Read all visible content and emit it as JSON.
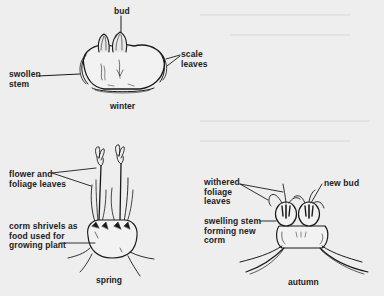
{
  "diagram": {
    "panels": [
      {
        "id": "winter",
        "caption": "winter",
        "labels": {
          "bud": "bud",
          "scale_leaves": "scale\nleaves",
          "swollen_stem": "swollen\nstem"
        }
      },
      {
        "id": "spring",
        "caption": "spring",
        "labels": {
          "flower_foliage": "flower and\nfoliage leaves",
          "corm_shrivels": "corm shrivels as\nfood used for\ngrowing plant"
        }
      },
      {
        "id": "autumn",
        "caption": "autumn",
        "labels": {
          "withered": "withered\nfoliage\nleaves",
          "new_bud": "new bud",
          "swelling_stem": "swelling stem\nforming new\ncorm"
        }
      }
    ]
  },
  "colors": {
    "background": "#eeeeee",
    "ink": "#1a1a1a"
  }
}
